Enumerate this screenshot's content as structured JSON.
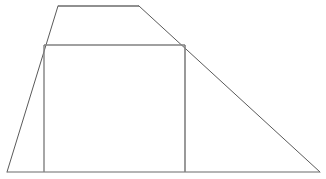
{
  "figure": {
    "background_color": "#ffffff",
    "canvas": {
      "width": 326,
      "height": 179
    },
    "stroke": {
      "outline_color": "#5a5a5a",
      "outline_width": 1,
      "rectangle_color": "#808080",
      "rectangle_width": 1.4
    },
    "shapes": {
      "trapezoid": {
        "name": "outer-trapezoid",
        "kind": "polygon",
        "fill": "none",
        "points": "7,172 58,6 139,6 320,172",
        "vertices": [
          {
            "label": "bottom-left",
            "x": 7,
            "y": 172
          },
          {
            "label": "top-left",
            "x": 58,
            "y": 6
          },
          {
            "label": "top-right",
            "x": 139,
            "y": 6
          },
          {
            "label": "bottom-right",
            "x": 320,
            "y": 172
          }
        ],
        "edges": [
          {
            "name": "left-slant",
            "x1": 7,
            "y1": 172,
            "x2": 58,
            "y2": 6
          },
          {
            "name": "top-base",
            "x1": 58,
            "y1": 6,
            "x2": 139,
            "y2": 6
          },
          {
            "name": "right-slant",
            "x1": 139,
            "y1": 6,
            "x2": 320,
            "y2": 172
          },
          {
            "name": "bottom-base",
            "x1": 7,
            "y1": 172,
            "x2": 320,
            "y2": 172
          }
        ]
      },
      "rectangle": {
        "name": "inscribed-rectangle",
        "kind": "rect",
        "fill": "none",
        "x": 44,
        "y": 45,
        "width": 141,
        "height": 127,
        "corners": [
          {
            "label": "top-left",
            "x": 44,
            "y": 45
          },
          {
            "label": "top-right",
            "x": 185,
            "y": 45
          },
          {
            "label": "bottom-right",
            "x": 185,
            "y": 172
          },
          {
            "label": "bottom-left",
            "x": 44,
            "y": 172
          }
        ],
        "edges": [
          {
            "name": "rect-top",
            "x1": 44,
            "y1": 45,
            "x2": 185,
            "y2": 45
          },
          {
            "name": "rect-right",
            "x1": 185,
            "y1": 45,
            "x2": 185,
            "y2": 172
          },
          {
            "name": "rect-left",
            "x1": 44,
            "y1": 45,
            "x2": 44,
            "y2": 172
          }
        ]
      }
    },
    "labels": []
  }
}
